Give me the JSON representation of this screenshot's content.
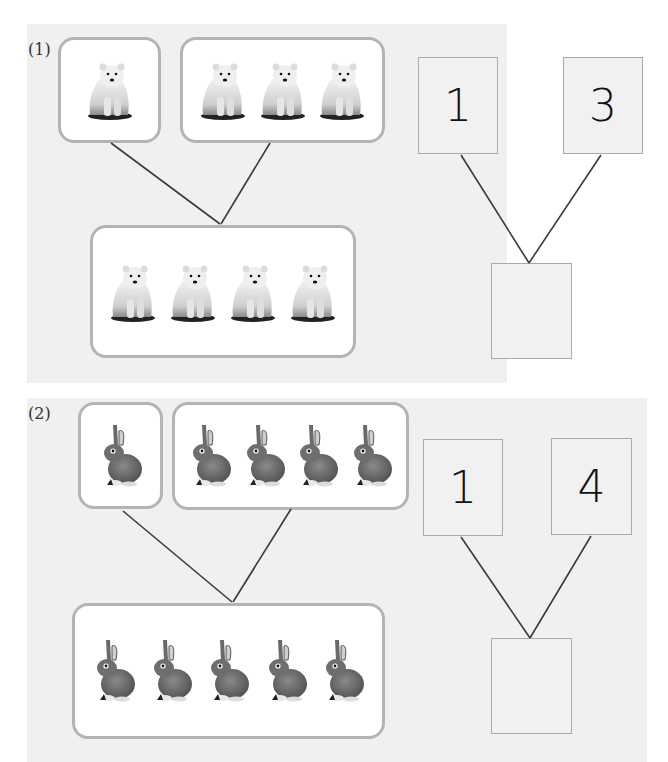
{
  "problems": [
    {
      "label": "(1)",
      "animal": "polar-bear",
      "part_a_count": 1,
      "part_b_count": 3,
      "whole_count": 4,
      "number_bond": {
        "left": "1",
        "right": "3",
        "answer": ""
      }
    },
    {
      "label": "(2)",
      "animal": "rabbit",
      "part_a_count": 1,
      "part_b_count": 4,
      "whole_count": 5,
      "number_bond": {
        "left": "1",
        "right": "4",
        "answer": ""
      }
    }
  ],
  "colors": {
    "panel": "#f0f0f0",
    "box_border": "#b4b4b4",
    "line": "#3a3a3a",
    "number_box_border": "#a9a9a9"
  }
}
